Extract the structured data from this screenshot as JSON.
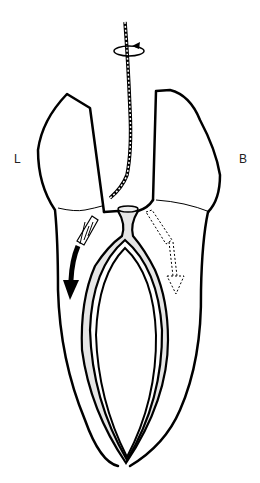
{
  "diagram": {
    "labels": {
      "left": "L",
      "right": "B"
    },
    "annotations": [
      {
        "name": "rotation-arrow",
        "meaning": "file rotation"
      },
      {
        "name": "solid-arrow",
        "meaning": "force direction toward lingual"
      },
      {
        "name": "dashed-arrow",
        "meaning": "force direction toward buccal"
      }
    ],
    "colors": {
      "stroke": "#000000",
      "pulp_fill": "#e6e6e6",
      "background": "#ffffff"
    }
  }
}
